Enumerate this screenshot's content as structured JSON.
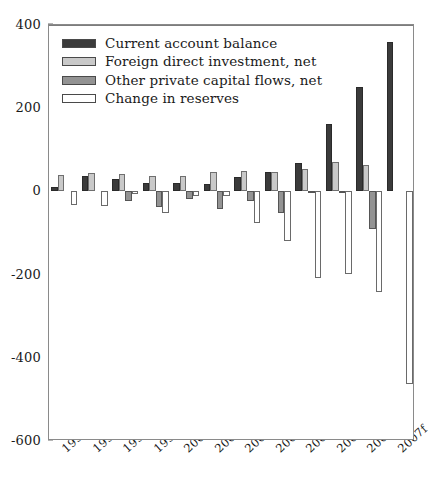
{
  "chart_data": {
    "type": "bar",
    "title": "",
    "xlabel": "",
    "ylabel": "",
    "grid": false,
    "legend_position": "top-left",
    "ylim": [
      -600,
      400
    ],
    "yticks": [
      400,
      200,
      0,
      -200,
      -400,
      -600
    ],
    "ytick_labels": [
      "400",
      "200",
      "0",
      "-200",
      "-400",
      "-600"
    ],
    "categories": [
      "1996",
      "1997",
      "1998",
      "1999",
      "2000",
      "2001",
      "2002",
      "2003",
      "2004",
      "2005",
      "2006",
      "2007f"
    ],
    "series": [
      {
        "name": "Current account balance",
        "color": "#3b3b3b",
        "values": [
          11,
          37,
          31,
          21,
          21,
          17,
          35,
          46,
          69,
          161,
          250,
          360
        ]
      },
      {
        "name": "Foreign direct investment, net",
        "color": "#c9c9c9",
        "values": [
          39,
          45,
          41,
          37,
          38,
          47,
          49,
          47,
          53,
          71,
          63,
          0
        ]
      },
      {
        "name": "Other private capital flows, net",
        "color": "#939393",
        "values": [
          0,
          0,
          -24,
          -38,
          -18,
          -42,
          -23,
          -51,
          -5,
          -2,
          -90,
          0
        ]
      },
      {
        "name": "Change in reserves",
        "color": "#ffffff",
        "values": [
          -32,
          -36,
          -6,
          -51,
          -10,
          -11,
          -76,
          -120,
          -208,
          -199,
          -243,
          -462
        ]
      }
    ]
  },
  "legend": {
    "items": [
      {
        "label": "Current account balance",
        "swatch": "dark-gray-swatch"
      },
      {
        "label": "Foreign direct investment, net",
        "swatch": "light-gray-swatch"
      },
      {
        "label": "Other private capital flows, net",
        "swatch": "medium-gray-swatch"
      },
      {
        "label": "Change in reserves",
        "swatch": "white-swatch"
      }
    ]
  }
}
